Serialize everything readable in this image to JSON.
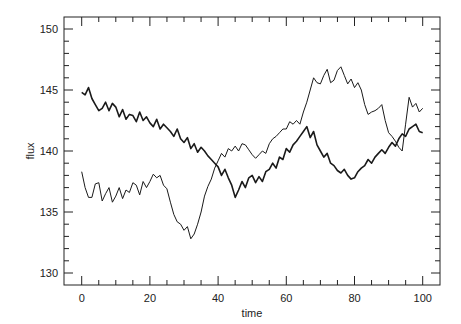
{
  "chart_data": {
    "type": "line",
    "title": "",
    "xlabel": "time",
    "ylabel": "flux",
    "xlim": [
      -4,
      104
    ],
    "ylim": [
      129,
      151
    ],
    "grid": false,
    "legend": null,
    "xticks": [
      0,
      20,
      40,
      60,
      80,
      100
    ],
    "yticks": [
      130,
      135,
      140,
      145,
      150
    ],
    "series": [
      {
        "name": "series-1 (thick)",
        "stroke_width": 1.6,
        "x": [
          0,
          1,
          2,
          3,
          4,
          5,
          6,
          7,
          8,
          9,
          10,
          11,
          12,
          13,
          14,
          15,
          16,
          17,
          18,
          19,
          20,
          21,
          22,
          23,
          24,
          25,
          26,
          27,
          28,
          29,
          30,
          31,
          32,
          33,
          34,
          35,
          36,
          37,
          38,
          39,
          40,
          41,
          42,
          43,
          44,
          45,
          46,
          47,
          48,
          49,
          50,
          51,
          52,
          53,
          54,
          55,
          56,
          57,
          58,
          59,
          60,
          61,
          62,
          63,
          64,
          65,
          66,
          67,
          68,
          69,
          70,
          71,
          72,
          73,
          74,
          75,
          76,
          77,
          78,
          79,
          80,
          81,
          82,
          83,
          84,
          85,
          86,
          87,
          88,
          89,
          90,
          91,
          92,
          93,
          94,
          95,
          96,
          97,
          98,
          99,
          100
        ],
        "y": [
          144.8,
          144.6,
          145.2,
          144.3,
          143.8,
          143.3,
          143.5,
          144.0,
          143.3,
          143.9,
          143.6,
          142.8,
          143.4,
          142.6,
          143.0,
          142.9,
          142.4,
          143.2,
          142.5,
          142.8,
          142.3,
          142.0,
          142.6,
          141.8,
          142.2,
          141.9,
          141.6,
          141.2,
          141.8,
          141.0,
          140.7,
          141.1,
          140.2,
          140.6,
          139.9,
          140.3,
          140.0,
          139.6,
          139.3,
          139.0,
          138.7,
          138.0,
          138.5,
          137.8,
          137.2,
          136.2,
          136.8,
          137.5,
          137.0,
          137.8,
          138.0,
          137.4,
          137.9,
          137.5,
          138.3,
          138.5,
          139.0,
          138.6,
          139.5,
          139.3,
          140.2,
          139.9,
          140.5,
          140.8,
          141.2,
          141.6,
          142.0,
          141.1,
          141.6,
          140.5,
          140.0,
          139.5,
          139.8,
          139.0,
          138.8,
          138.4,
          138.2,
          138.5,
          138.0,
          137.7,
          137.8,
          138.3,
          138.6,
          138.8,
          139.3,
          139.0,
          139.5,
          139.8,
          140.1,
          139.8,
          140.3,
          140.7,
          140.4,
          141.0,
          141.4,
          141.2,
          141.8,
          142.0,
          142.2,
          141.6,
          141.5
        ]
      },
      {
        "name": "series-2 (thin)",
        "stroke_width": 1.0,
        "x": [
          0,
          1,
          2,
          3,
          4,
          5,
          6,
          7,
          8,
          9,
          10,
          11,
          12,
          13,
          14,
          15,
          16,
          17,
          18,
          19,
          20,
          21,
          22,
          23,
          24,
          25,
          26,
          27,
          28,
          29,
          30,
          31,
          32,
          33,
          34,
          35,
          36,
          37,
          38,
          39,
          40,
          41,
          42,
          43,
          44,
          45,
          46,
          47,
          48,
          49,
          50,
          51,
          52,
          53,
          54,
          55,
          56,
          57,
          58,
          59,
          60,
          61,
          62,
          63,
          64,
          65,
          66,
          67,
          68,
          69,
          70,
          71,
          72,
          73,
          74,
          75,
          76,
          77,
          78,
          79,
          80,
          81,
          82,
          83,
          84,
          85,
          86,
          87,
          88,
          89,
          90,
          91,
          92,
          93,
          94,
          95,
          96,
          97,
          98,
          99,
          100
        ],
        "y": [
          138.3,
          137.0,
          136.2,
          136.2,
          137.3,
          137.4,
          135.9,
          136.5,
          137.0,
          135.8,
          136.3,
          137.0,
          136.1,
          136.8,
          136.6,
          137.4,
          137.2,
          136.4,
          137.5,
          137.0,
          137.5,
          138.1,
          137.8,
          138.0,
          137.2,
          136.9,
          135.8,
          134.8,
          134.2,
          134.0,
          133.5,
          133.8,
          132.8,
          133.2,
          134.0,
          135.0,
          136.3,
          137.1,
          137.7,
          138.6,
          139.2,
          139.8,
          139.5,
          140.2,
          140.0,
          140.4,
          140.0,
          140.6,
          140.5,
          140.1,
          139.7,
          139.4,
          139.7,
          140.0,
          139.8,
          140.6,
          141.0,
          141.2,
          141.5,
          141.8,
          141.8,
          142.4,
          142.2,
          142.5,
          142.2,
          143.2,
          144.0,
          145.0,
          146.0,
          145.6,
          145.5,
          146.2,
          146.7,
          145.6,
          145.8,
          146.6,
          146.9,
          146.2,
          145.5,
          145.9,
          145.2,
          145.6,
          145.0,
          143.8,
          143.0,
          143.2,
          143.3,
          143.5,
          143.8,
          142.5,
          141.5,
          141.2,
          140.8,
          140.3,
          140.0,
          142.2,
          144.4,
          143.6,
          143.9,
          143.2,
          143.5
        ]
      }
    ]
  }
}
